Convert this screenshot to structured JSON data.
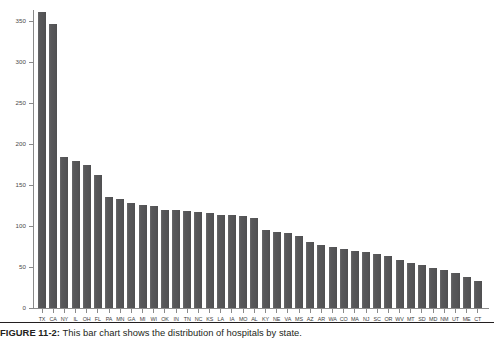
{
  "figure": {
    "caption_label": "FIGURE 11-2:",
    "caption_text": "This bar chart shows the distribution of hospitals by state."
  },
  "chart_data": {
    "type": "bar",
    "title": "",
    "xlabel": "",
    "ylabel": "",
    "ylim": [
      0,
      370
    ],
    "yticks": [
      0,
      50,
      100,
      150,
      200,
      250,
      300,
      350
    ],
    "ytick_labels": [
      "0",
      "50",
      "100",
      "150",
      "200",
      "250",
      "300",
      "350"
    ],
    "grid": false,
    "legend": null,
    "bar_color": "#58585a",
    "axis_color": "#8a8a8a",
    "categories": [
      "TX",
      "CA",
      "NY",
      "IL",
      "OH",
      "FL",
      "PA",
      "MN",
      "GA",
      "MI",
      "WI",
      "OK",
      "IN",
      "TN",
      "NC",
      "KS",
      "LA",
      "IA",
      "MO",
      "AL",
      "KY",
      "NE",
      "VA",
      "MS",
      "AZ",
      "AR",
      "WA",
      "CO",
      "MA",
      "NJ",
      "SC",
      "OR",
      "WV",
      "MT",
      "SD",
      "MD",
      "NM",
      "UT",
      "ME",
      "CT"
    ],
    "values": [
      361,
      346,
      184,
      179,
      174,
      162,
      135,
      133,
      128,
      126,
      124,
      120,
      119,
      118,
      117,
      116,
      114,
      113,
      112,
      110,
      95,
      93,
      91,
      88,
      80,
      77,
      74,
      72,
      70,
      68,
      66,
      63,
      59,
      55,
      52,
      49,
      46,
      43,
      38,
      33
    ]
  }
}
